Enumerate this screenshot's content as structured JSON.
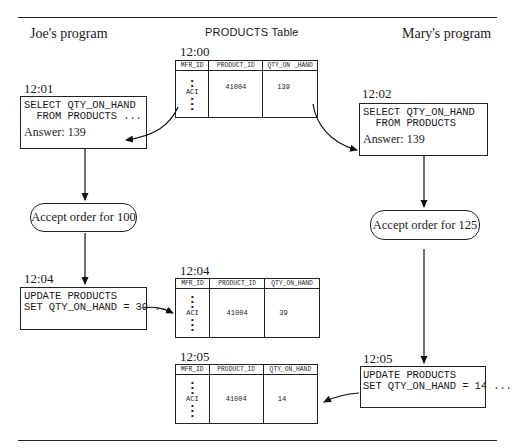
{
  "headings": {
    "left": "Joe's program",
    "center": "PRODUCTS Table",
    "right": "Mary's program"
  },
  "columns": [
    "MFR_ID",
    "PRODUCT_ID",
    "QTY_ON_HAND"
  ],
  "tables": [
    {
      "time": "12:00",
      "header": [
        "MFR_ID",
        "PRODUCT_ID",
        "QTY_ON _HAND"
      ],
      "mfr_id": "ACI",
      "product_id": "41004",
      "qty_on_hand": "139"
    },
    {
      "time": "12:04",
      "header": [
        "MFR_ID",
        "PRODUCT_ID",
        "QTY_ON_HAND"
      ],
      "mfr_id": "ACI",
      "product_id": "41004",
      "qty_on_hand": "39"
    },
    {
      "time": "12:05",
      "header": [
        "MFR_ID",
        "PRODUCT_ID",
        "QTY_ON_HAND"
      ],
      "mfr_id": "ACI",
      "product_id": "41004",
      "qty_on_hand": "14"
    }
  ],
  "joe": {
    "select": {
      "time": "12:01",
      "line1": "SELECT QTY_ON_HAND",
      "line2": "  FROM PRODUCTS ...",
      "answer": "Answer: 139"
    },
    "decision": "Accept order for 100",
    "update": {
      "time": "12:04",
      "line1": "UPDATE PRODUCTS",
      "line2": "SET QTY_ON_HAND = 39 ..."
    }
  },
  "mary": {
    "select": {
      "time": "12:02",
      "line1": "SELECT QTY_ON_HAND",
      "line2": "  FROM PRODUCTS",
      "answer": "Answer: 139"
    },
    "decision": "Accept order for 125",
    "update": {
      "time": "12:05",
      "line1": "UPDATE PRODUCTS",
      "line2": "SET QTY_ON_HAND = 14 ..."
    }
  }
}
